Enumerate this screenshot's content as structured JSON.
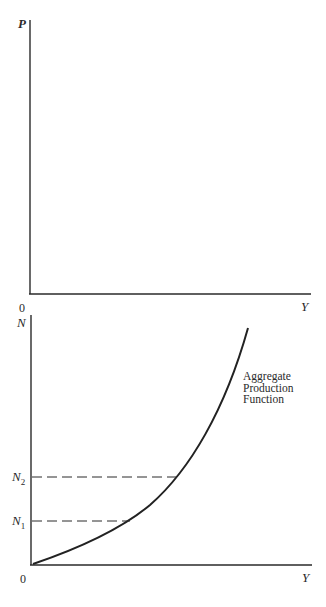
{
  "top_fragment": "",
  "upper_panel": {
    "y_axis_label": "P",
    "x_axis_label": "Y",
    "origin_label": "0"
  },
  "lower_panel": {
    "y_axis_label": "N",
    "x_axis_label": "Y",
    "origin_label": "0",
    "curve_label_lines": [
      "Aggregate",
      "Production",
      "Function"
    ],
    "levels": [
      {
        "label": "N",
        "subscript": "2"
      },
      {
        "label": "N",
        "subscript": "1"
      }
    ]
  },
  "colors": {
    "ink": "#2a2a2a",
    "background": "#ffffff"
  }
}
